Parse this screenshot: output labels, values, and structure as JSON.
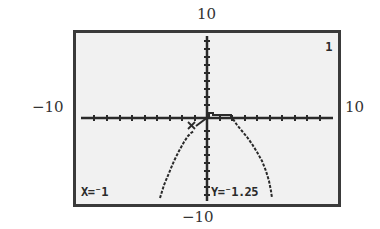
{
  "window_labels": {
    "ymax": "10",
    "ymin": "−10",
    "xmin": "−10",
    "xmax": "10"
  },
  "screen": {
    "graph_number": "1",
    "trace_x": "X=⁻1",
    "trace_y": "Y=⁻1.25"
  },
  "colors": {
    "screen_bg": "#f1f1f1",
    "ink": "#2a2a2a",
    "frame": "#3a3a3a"
  }
}
